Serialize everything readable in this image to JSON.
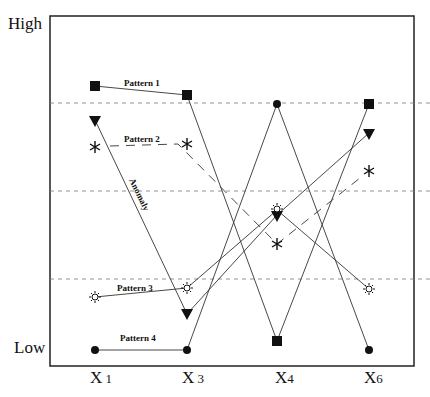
{
  "diagram": {
    "y_axis": {
      "high_label": "High",
      "low_label": "Low"
    },
    "x_axis": {
      "ticks": [
        {
          "letter": "X",
          "num": " 1"
        },
        {
          "letter": "X",
          "num": " 3"
        },
        {
          "letter": "X",
          "num": "4"
        },
        {
          "letter": "X",
          "num": "6"
        }
      ]
    },
    "series": [
      {
        "name": "Pattern 1",
        "marker": "filled-square",
        "line": "solid"
      },
      {
        "name": "Pattern 2",
        "marker": "asterisk-star",
        "line": "dashed"
      },
      {
        "name": "Pattern 3",
        "marker": "open-sun",
        "line": "solid"
      },
      {
        "name": "Pattern 4",
        "marker": "filled-circle",
        "line": "solid"
      },
      {
        "name": "Anomaly",
        "marker": "filled-down-triangle",
        "line": "solid"
      }
    ],
    "labels": {
      "pattern1": "Pattern 1",
      "pattern2": "Pattern 2",
      "pattern3": "Pattern 3",
      "pattern4": "Pattern 4",
      "anomaly": "Anomaly"
    },
    "threshold_lines": 3
  }
}
